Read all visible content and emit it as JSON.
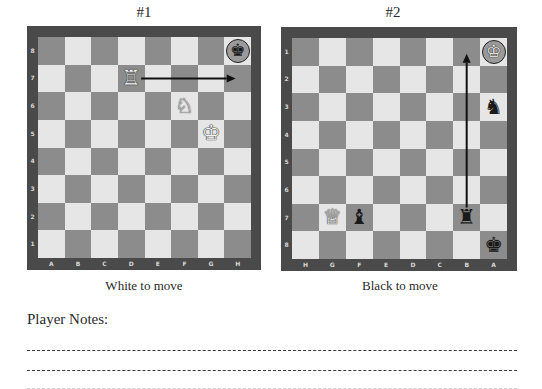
{
  "puzzles": [
    {
      "title": "#1",
      "caption": "White to move",
      "orientation": "white",
      "files": [
        "A",
        "B",
        "C",
        "D",
        "E",
        "F",
        "G",
        "H"
      ],
      "ranks": [
        "8",
        "7",
        "6",
        "5",
        "4",
        "3",
        "2",
        "1"
      ],
      "pieces": [
        {
          "square": "d7",
          "piece": "rook",
          "color": "white",
          "glyph": "♖"
        },
        {
          "square": "f6",
          "piece": "knight",
          "color": "white",
          "glyph": "♘"
        },
        {
          "square": "g5",
          "piece": "king",
          "color": "white",
          "glyph": "♔"
        },
        {
          "square": "h8",
          "piece": "king",
          "color": "black",
          "glyph": "♚",
          "highlight": "check-circle"
        }
      ],
      "arrow": {
        "from": "d7",
        "to": "h7"
      }
    },
    {
      "title": "#2",
      "caption": "Black to move",
      "orientation": "black",
      "files": [
        "H",
        "G",
        "F",
        "E",
        "D",
        "C",
        "B",
        "A"
      ],
      "ranks": [
        "1",
        "2",
        "3",
        "4",
        "5",
        "6",
        "7",
        "8"
      ],
      "pieces": [
        {
          "square": "a1",
          "piece": "king",
          "color": "white",
          "glyph": "♔",
          "highlight": "check-circle"
        },
        {
          "square": "a3",
          "piece": "knight",
          "color": "black",
          "glyph": "♞"
        },
        {
          "square": "g7",
          "piece": "queen",
          "color": "white",
          "glyph": "♕"
        },
        {
          "square": "f7",
          "piece": "bishop",
          "color": "black",
          "glyph": "♝"
        },
        {
          "square": "b7",
          "piece": "rook",
          "color": "black",
          "glyph": "♜"
        },
        {
          "square": "a8",
          "piece": "king",
          "color": "black",
          "glyph": "♚"
        }
      ],
      "arrow": {
        "from": "b7",
        "to": "b1"
      }
    }
  ],
  "notes": {
    "label": "Player Notes:",
    "line_count": 2
  },
  "colors": {
    "light_square": "#e6e6e6",
    "dark_square": "#8c8c8c",
    "border": "#4a4a4a",
    "arrow": "#111111"
  }
}
